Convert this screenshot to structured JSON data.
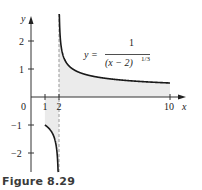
{
  "caption": "Figure 8.29",
  "equation": {
    "lhs": "y =",
    "numerator": "1",
    "denominator": "(x − 2)",
    "exponent": "1/3"
  },
  "colors": {
    "curve": "#1a1a1a",
    "shade": "#ebebeb",
    "axis": "#333333",
    "asymptote": "#9a9a9a"
  },
  "chart_data": {
    "type": "line",
    "title": "",
    "function": "y = 1/(x-2)^(1/3)",
    "xlabel": "x",
    "ylabel": "y",
    "x_ticks": [
      {
        "value": 0,
        "label": "0"
      },
      {
        "value": 1,
        "label": "1"
      },
      {
        "value": 2,
        "label": "2"
      },
      {
        "value": 10,
        "label": "10"
      }
    ],
    "y_ticks": [
      {
        "value": 2,
        "label": "2"
      },
      {
        "value": 1,
        "label": "1"
      },
      {
        "value": -1,
        "label": "−1"
      },
      {
        "value": -2,
        "label": "−2"
      }
    ],
    "xlim": [
      0,
      11
    ],
    "ylim": [
      -2.7,
      2.9
    ],
    "vertical_asymptote": 2,
    "series": [
      {
        "name": "left branch",
        "x": [
          1,
          1.2,
          1.4,
          1.6,
          1.8,
          1.9,
          1.95,
          1.99
        ],
        "values": [
          -1,
          -1.08,
          -1.19,
          -1.36,
          -1.71,
          -2.15,
          -2.71,
          -4.64
        ]
      },
      {
        "name": "right branch",
        "x": [
          2.01,
          2.05,
          2.1,
          2.3,
          2.5,
          3,
          4,
          6,
          8,
          10
        ],
        "values": [
          4.64,
          2.71,
          2.15,
          1.49,
          1.26,
          1,
          0.79,
          0.63,
          0.55,
          0.5
        ]
      }
    ],
    "shaded_regions": [
      {
        "x_from": 1,
        "x_to": 2,
        "between": "curve and x-axis"
      },
      {
        "x_from": 2,
        "x_to": 10,
        "between": "x-axis and curve"
      }
    ],
    "grid": false,
    "legend": "none"
  }
}
